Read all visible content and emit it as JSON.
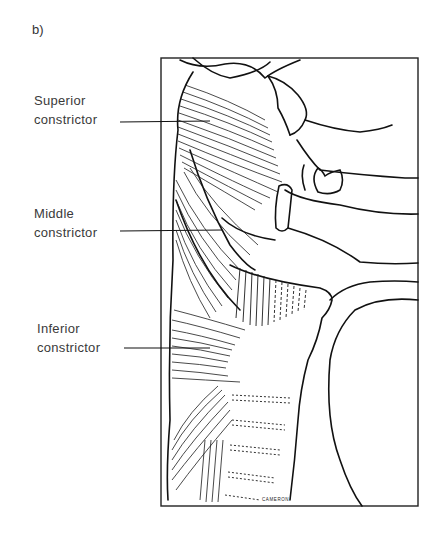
{
  "figure": {
    "panel_label": "b)",
    "signature": "CAMERON",
    "labels": [
      {
        "id": "superior",
        "line1": "Superior",
        "line2": "constrictor"
      },
      {
        "id": "middle",
        "line1": "Middle",
        "line2": "constrictor"
      },
      {
        "id": "inferior",
        "line1": "Inferior",
        "line2": "constrictor"
      }
    ],
    "colors": {
      "ink": "#1a1a1a",
      "text": "#3a3a3a",
      "background": "#ffffff"
    }
  }
}
